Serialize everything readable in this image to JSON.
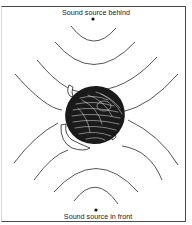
{
  "figure": {
    "type": "diagram",
    "labels": {
      "source_behind": "Sound source behind",
      "source_front": "Sound source in front"
    },
    "sources": [
      {
        "id": "behind",
        "position": "top",
        "x": 93,
        "y": 19
      },
      {
        "id": "front",
        "position": "bottom",
        "x": 96,
        "y": 210
      }
    ],
    "wavefronts_per_source": 4,
    "colors": {
      "line": "#2a2a2a",
      "frame": "#4a4a4a",
      "background": "#ffffff"
    }
  }
}
